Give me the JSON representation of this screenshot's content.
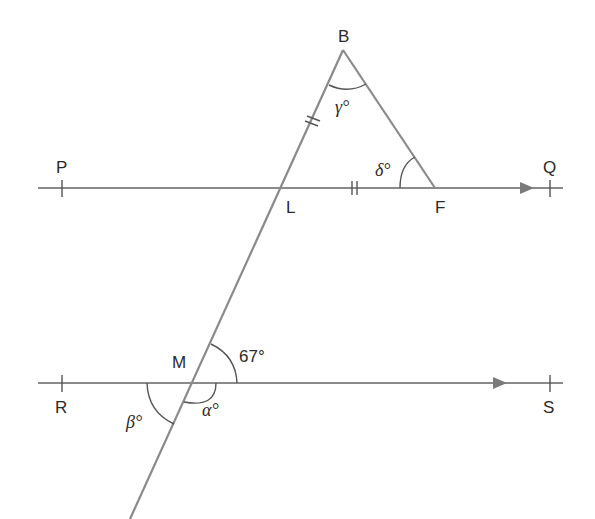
{
  "diagram": {
    "type": "geometry",
    "colors": {
      "line": "#8a8a8a",
      "ink": "#2a2a2a"
    },
    "points": {
      "B": "B",
      "P": "P",
      "Q": "Q",
      "L": "L",
      "F": "F",
      "M": "M",
      "R": "R",
      "S": "S"
    },
    "angles": {
      "gamma": "γ°",
      "delta": "δ°",
      "given": "67°",
      "alpha": "α°",
      "beta": "β°"
    },
    "markings": {
      "equal_sides": [
        "BL",
        "LF"
      ],
      "parallel_lines": [
        "PQ",
        "RS"
      ]
    }
  }
}
